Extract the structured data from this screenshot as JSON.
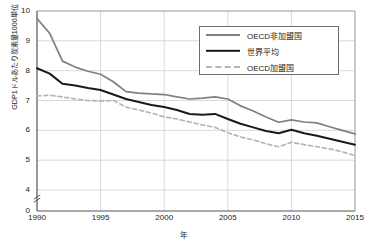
{
  "chart_data": {
    "type": "line",
    "title": "",
    "xlabel": "年",
    "ylabel": "GDP1ドルあたり炭素量1000単位",
    "xlim": [
      1990,
      2015
    ],
    "ylim": [
      4,
      10
    ],
    "y_axis_break": true,
    "y_zero_tick": "0",
    "grid": true,
    "legend_position": "top-right",
    "x_ticks": [
      "1990",
      "1995",
      "2000",
      "2005",
      "2010",
      "2015"
    ],
    "y_ticks": [
      "0",
      "4",
      "5",
      "6",
      "7",
      "8",
      "9",
      "10"
    ],
    "x": [
      1990,
      1991,
      1992,
      1993,
      1994,
      1995,
      1996,
      1997,
      1998,
      1999,
      2000,
      2001,
      2002,
      2003,
      2004,
      2005,
      2006,
      2007,
      2008,
      2009,
      2010,
      2011,
      2012,
      2013,
      2014,
      2015
    ],
    "series": [
      {
        "name": "OECD非加盟国",
        "color": "#808080",
        "style": "solid",
        "values": [
          9.75,
          9.25,
          8.32,
          8.12,
          7.98,
          7.88,
          7.63,
          7.3,
          7.25,
          7.22,
          7.2,
          7.12,
          7.05,
          7.08,
          7.12,
          7.05,
          6.82,
          6.65,
          6.45,
          6.27,
          6.35,
          6.28,
          6.25,
          6.12,
          6.0,
          5.88
        ]
      },
      {
        "name": "世界平均",
        "color": "#1a1a1a",
        "style": "solid",
        "values": [
          8.08,
          7.9,
          7.56,
          7.5,
          7.42,
          7.35,
          7.2,
          7.05,
          6.95,
          6.85,
          6.78,
          6.68,
          6.55,
          6.52,
          6.55,
          6.38,
          6.22,
          6.1,
          5.98,
          5.9,
          6.02,
          5.9,
          5.82,
          5.72,
          5.62,
          5.52
        ]
      },
      {
        "name": "OECD加盟国",
        "color": "#b5b5b5",
        "style": "dashed",
        "values": [
          7.15,
          7.18,
          7.12,
          7.05,
          7.0,
          6.98,
          7.0,
          6.78,
          6.68,
          6.58,
          6.45,
          6.38,
          6.28,
          6.18,
          6.1,
          5.92,
          5.78,
          5.68,
          5.55,
          5.45,
          5.6,
          5.52,
          5.45,
          5.38,
          5.28,
          5.15
        ]
      }
    ]
  },
  "legend": {
    "items": [
      {
        "label": "OECD非加盟国"
      },
      {
        "label": "世界平均"
      },
      {
        "label": "OECD加盟国"
      }
    ]
  }
}
